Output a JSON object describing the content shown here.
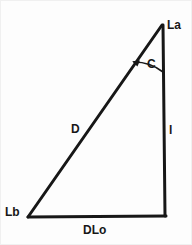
{
  "figure": {
    "type": "geometry-diagram",
    "shape": "right-triangle",
    "background_color": "#fdfdfd",
    "stroke_color": "#171717",
    "vertices": {
      "apex": {
        "label": "La",
        "x": 162,
        "y": 25
      },
      "bottom_left": {
        "label": "Lb",
        "x": 28,
        "y": 217
      },
      "bottom_right": {
        "label": "",
        "x": 165,
        "y": 215
      }
    },
    "sides": [
      {
        "name": "hypotenuse",
        "label": "D",
        "from": "Lb",
        "to": "La"
      },
      {
        "name": "vertical-leg",
        "label": "l",
        "from": "La",
        "to": "bottom_right"
      },
      {
        "name": "horizontal-leg",
        "label": "DLo",
        "from": "Lb",
        "to": "bottom_right"
      }
    ],
    "angles": [
      {
        "name": "apex-angle",
        "label": "C",
        "at": "La",
        "marker": "arc-with-arrowhead",
        "arrow_end": "hypotenuse"
      }
    ],
    "labels": {
      "apex": "La",
      "angle": "C",
      "hypotenuse": "D",
      "vertical": "l",
      "bottom_left": "Lb",
      "bottom": "DLo"
    }
  }
}
